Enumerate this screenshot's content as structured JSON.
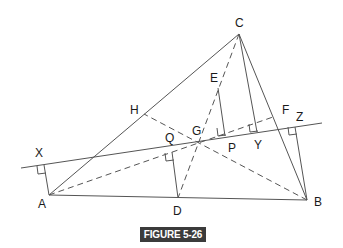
{
  "figure": {
    "caption": "FIGURE 5-26",
    "caption_bg": "#3b3b3b",
    "caption_fg": "#ffffff",
    "line_color": "#555555"
  },
  "points": {
    "A": {
      "label": "A",
      "x": 49,
      "y": 195
    },
    "B": {
      "label": "B",
      "x": 307,
      "y": 200
    },
    "C": {
      "label": "C",
      "x": 239,
      "y": 34
    },
    "D": {
      "label": "D",
      "x": 178,
      "y": 198
    },
    "E": {
      "label": "E",
      "x": 218,
      "y": 88
    },
    "F": {
      "label": "F",
      "x": 273,
      "y": 117
    },
    "G": {
      "label": "G",
      "x": 198,
      "y": 143
    },
    "H": {
      "label": "H",
      "x": 144,
      "y": 114
    },
    "P": {
      "label": "P",
      "x": 225,
      "y": 136
    },
    "Q": {
      "label": "Q",
      "x": 172,
      "y": 152
    },
    "X": {
      "label": "X",
      "x": 44,
      "y": 165
    },
    "Y": {
      "label": "Y",
      "x": 257,
      "y": 132
    },
    "Z": {
      "label": "Z",
      "x": 295,
      "y": 127
    }
  },
  "labels": [
    {
      "text": "C",
      "x": 235,
      "y": 17
    },
    {
      "text": "E",
      "x": 210,
      "y": 72
    },
    {
      "text": "H",
      "x": 130,
      "y": 104
    },
    {
      "text": "F",
      "x": 282,
      "y": 104
    },
    {
      "text": "Z",
      "x": 296,
      "y": 111
    },
    {
      "text": "Q",
      "x": 165,
      "y": 132
    },
    {
      "text": "G",
      "x": 192,
      "y": 125
    },
    {
      "text": "P",
      "x": 228,
      "y": 142
    },
    {
      "text": "Y",
      "x": 254,
      "y": 139
    },
    {
      "text": "X",
      "x": 35,
      "y": 147
    },
    {
      "text": "A",
      "x": 38,
      "y": 198
    },
    {
      "text": "D",
      "x": 173,
      "y": 205
    },
    {
      "text": "B",
      "x": 314,
      "y": 196
    }
  ]
}
